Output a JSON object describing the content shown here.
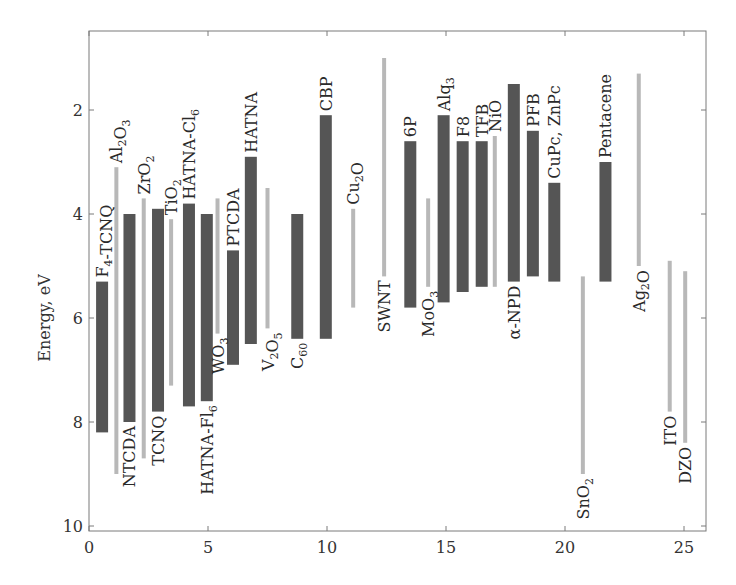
{
  "chart_data": {
    "type": "bar",
    "subtype": "floating-range",
    "title": "",
    "xlabel": "",
    "ylabel": "Energy, eV",
    "xlim": [
      0,
      26
    ],
    "ylim": [
      10,
      0.5
    ],
    "y_inverted": true,
    "grid": false,
    "legend": null,
    "x_ticks": [
      0,
      5,
      10,
      15,
      20,
      25
    ],
    "y_ticks": [
      2,
      4,
      6,
      8,
      10
    ],
    "colors": {
      "organic": "#555555",
      "inorganic": "#b8b8b8"
    },
    "series": [
      {
        "name": "F4-TCNQ",
        "label": "F",
        "sub": "4",
        "label_tail": "-TCNQ",
        "x": 0.55,
        "top": 5.3,
        "bottom": 8.2,
        "kind": "organic",
        "label_pos": "above"
      },
      {
        "name": "Al2O3",
        "label": "Al",
        "sub": "2",
        "label_tail": "O",
        "sub2": "3",
        "x": 1.15,
        "top": 3.1,
        "bottom": 9.0,
        "kind": "inorganic",
        "label_pos": "above"
      },
      {
        "name": "NTCDA",
        "label": "NTCDA",
        "x": 1.7,
        "top": 4.0,
        "bottom": 8.0,
        "kind": "organic",
        "label_pos": "below"
      },
      {
        "name": "ZrO2",
        "label": "ZrO",
        "sub": "2",
        "x": 2.3,
        "top": 3.7,
        "bottom": 8.7,
        "kind": "inorganic",
        "label_pos": "above"
      },
      {
        "name": "TCNQ",
        "label": "TCNQ",
        "x": 2.9,
        "top": 3.9,
        "bottom": 7.8,
        "kind": "organic",
        "label_pos": "below"
      },
      {
        "name": "TiO2",
        "label": "TiO",
        "sub": "2",
        "x": 3.45,
        "top": 4.1,
        "bottom": 7.3,
        "kind": "inorganic",
        "label_pos": "above"
      },
      {
        "name": "HATNA-Cl6",
        "label": "HATNA-Cl",
        "sub": "6",
        "x": 4.2,
        "top": 3.8,
        "bottom": 7.7,
        "kind": "organic",
        "label_pos": "above"
      },
      {
        "name": "HATNA-Fl6",
        "label": "HATNA-Fl",
        "sub": "6",
        "x": 4.95,
        "top": 4.0,
        "bottom": 7.6,
        "kind": "organic",
        "label_pos": "below"
      },
      {
        "name": "WO3",
        "label": "WO",
        "sub": "3",
        "x": 5.4,
        "top": 3.7,
        "bottom": 6.3,
        "kind": "inorganic",
        "label_pos": "below"
      },
      {
        "name": "PTCDA",
        "label": "PTCDA",
        "x": 6.05,
        "top": 4.7,
        "bottom": 6.9,
        "kind": "organic",
        "label_pos": "above"
      },
      {
        "name": "HATNA",
        "label": "HATNA",
        "x": 6.8,
        "top": 2.9,
        "bottom": 6.5,
        "kind": "organic",
        "label_pos": "above"
      },
      {
        "name": "V2O5",
        "label": "V",
        "sub": "2",
        "label_tail": "O",
        "sub2": "5",
        "x": 7.5,
        "top": 3.5,
        "bottom": 6.2,
        "kind": "inorganic",
        "label_pos": "below"
      },
      {
        "name": "C60",
        "label": "C",
        "sub": "60",
        "x": 8.75,
        "top": 4.0,
        "bottom": 6.4,
        "kind": "organic",
        "label_pos": "below"
      },
      {
        "name": "CBP",
        "label": "CBP",
        "x": 9.95,
        "top": 2.1,
        "bottom": 6.4,
        "kind": "organic",
        "label_pos": "above"
      },
      {
        "name": "Cu2O",
        "label": "Cu",
        "sub": "2",
        "label_tail": "O",
        "x": 11.1,
        "top": 3.9,
        "bottom": 5.8,
        "kind": "inorganic",
        "label_pos": "above"
      },
      {
        "name": "SWNT",
        "label": "SWNT",
        "x": 12.4,
        "top": 1.0,
        "bottom": 5.2,
        "kind": "inorganic",
        "label_pos": "below"
      },
      {
        "name": "6P",
        "label": "6P",
        "x": 13.5,
        "top": 2.6,
        "bottom": 5.8,
        "kind": "organic",
        "label_pos": "above"
      },
      {
        "name": "MoO3",
        "label": "MoO",
        "sub": "3",
        "x": 14.25,
        "top": 3.7,
        "bottom": 5.4,
        "kind": "inorganic",
        "label_pos": "below"
      },
      {
        "name": "Alq3",
        "label": "Alq",
        "sub": "3",
        "x": 14.9,
        "top": 2.1,
        "bottom": 5.7,
        "kind": "organic",
        "label_pos": "above"
      },
      {
        "name": "F8",
        "label": "F8",
        "x": 15.7,
        "top": 2.6,
        "bottom": 5.5,
        "kind": "organic",
        "label_pos": "above"
      },
      {
        "name": "TFB",
        "label": "TFB",
        "x": 16.5,
        "top": 2.6,
        "bottom": 5.4,
        "kind": "organic",
        "label_pos": "above"
      },
      {
        "name": "NiO",
        "label": "NiO",
        "x": 17.05,
        "top": 2.5,
        "bottom": 5.4,
        "kind": "inorganic",
        "label_pos": "above"
      },
      {
        "name": "α-NPD",
        "label": "α-NPD",
        "x": 17.85,
        "top": 1.5,
        "bottom": 5.3,
        "kind": "organic",
        "label_pos": "below"
      },
      {
        "name": "PFB",
        "label": "PFB",
        "x": 18.65,
        "top": 2.4,
        "bottom": 5.2,
        "kind": "organic",
        "label_pos": "above"
      },
      {
        "name": "CuPc, ZnPc",
        "label": "CuPc, ZnPc",
        "x": 19.55,
        "top": 3.4,
        "bottom": 5.3,
        "kind": "organic",
        "label_pos": "above"
      },
      {
        "name": "SnO2",
        "label": "SnO",
        "sub": "2",
        "x": 20.75,
        "top": 5.2,
        "bottom": 9.0,
        "kind": "inorganic",
        "label_pos": "below"
      },
      {
        "name": "Pentacene",
        "label": "Pentacene",
        "x": 21.7,
        "top": 3.0,
        "bottom": 5.3,
        "kind": "organic",
        "label_pos": "above"
      },
      {
        "name": "Ag2O",
        "label": "Ag",
        "sub": "2",
        "label_tail": "O",
        "x": 23.1,
        "top": 1.3,
        "bottom": 5.0,
        "kind": "inorganic",
        "label_pos": "below"
      },
      {
        "name": "ITO",
        "label": "ITO",
        "x": 24.4,
        "top": 4.9,
        "bottom": 7.8,
        "kind": "inorganic",
        "label_pos": "below"
      },
      {
        "name": "DZO",
        "label": "DZO",
        "x": 25.05,
        "top": 5.1,
        "bottom": 8.4,
        "kind": "inorganic",
        "label_pos": "below"
      }
    ]
  }
}
